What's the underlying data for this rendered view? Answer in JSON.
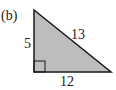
{
  "figure": {
    "part_label": "(b)",
    "shape": "right-triangle",
    "fill_color": "#bdbdbd",
    "stroke_color": "#1a1a1a",
    "sides": {
      "vertical_leg": "5",
      "hypotenuse": "13",
      "horizontal_leg": "12"
    },
    "right_angle_marker": true
  }
}
